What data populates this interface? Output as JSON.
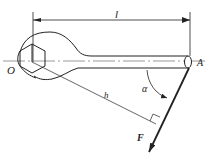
{
  "diagram": {
    "labels": {
      "length": "l",
      "pivot": "O",
      "end": "A",
      "angle": "α",
      "moment_arm": "h",
      "force": "F"
    },
    "colors": {
      "stroke": "#222222",
      "centerline": "#555555",
      "background": "#ffffff"
    }
  }
}
